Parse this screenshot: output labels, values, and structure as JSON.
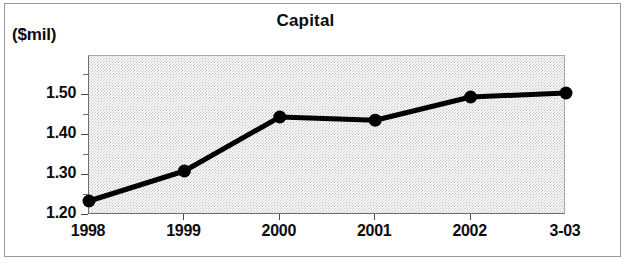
{
  "chart_data": {
    "type": "line",
    "title": "Capital",
    "unit_label": "($mil)",
    "xlabel": "",
    "ylabel": "",
    "categories": [
      "1998",
      "1999",
      "2000",
      "2001",
      "2002",
      "3-03"
    ],
    "values": [
      1.235,
      1.31,
      1.445,
      1.437,
      1.495,
      1.505
    ],
    "series": [
      {
        "name": "Capital",
        "values": [
          1.235,
          1.31,
          1.445,
          1.437,
          1.495,
          1.505
        ]
      }
    ],
    "ylim": [
      1.2,
      1.5975
    ],
    "y_major_ticks": [
      1.2,
      1.3,
      1.4,
      1.5
    ],
    "y_tick_labels": [
      "1.20",
      "1.30",
      "1.40",
      "1.50"
    ],
    "y_minor_ticks": [
      1.25,
      1.35,
      1.45,
      1.55
    ],
    "grid": false,
    "legend": "none",
    "marker": "filled-circle",
    "line_color": "#000000",
    "marker_color": "#000000",
    "plot_background": "#c9c9c9"
  }
}
